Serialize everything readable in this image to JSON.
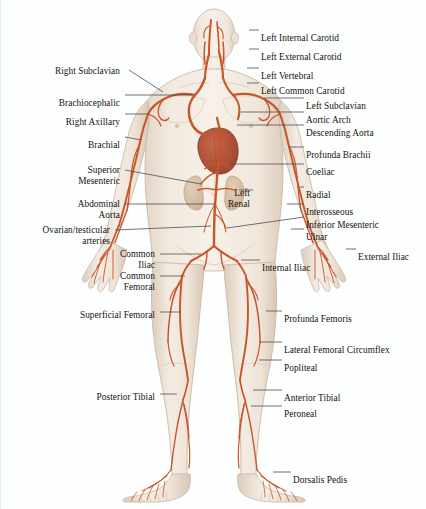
{
  "diagram": {
    "background_color": "#fdfefe",
    "artery_color": "#c8552b",
    "artery_color_dark": "#a8401f",
    "skin_fill": "#efe6dc",
    "skin_outline": "#c9b8a6",
    "heart_color": "#b4553c",
    "organ_color": "#d9c4ad",
    "leader_line_color": "#4a4a4a",
    "text_color": "#16130f"
  },
  "labels_left": [
    {
      "id": "right-subclavian",
      "text": "Right Subclavian",
      "x": 120,
      "y": 66,
      "align": "right",
      "lines": [
        "Right Subclavian"
      ]
    },
    {
      "id": "brachiocephalic",
      "text": "Brachiocephalic",
      "x": 120,
      "y": 98,
      "align": "right",
      "lines": [
        "Brachiocephalic"
      ]
    },
    {
      "id": "right-axillary",
      "text": "Right Axillary",
      "x": 120,
      "y": 117,
      "align": "right",
      "lines": [
        "Right Axillary"
      ]
    },
    {
      "id": "brachial",
      "text": "Brachial",
      "x": 120,
      "y": 140,
      "align": "right",
      "lines": [
        "Brachial"
      ]
    },
    {
      "id": "superior-mesenteric",
      "text": "Superior Mesenteric",
      "x": 120,
      "y": 165,
      "align": "right",
      "lines": [
        "Superior",
        "Mesenteric"
      ]
    },
    {
      "id": "abdominal-aorta",
      "text": "Abdominal Aorta",
      "x": 120,
      "y": 199,
      "align": "right",
      "lines": [
        "Abdominal",
        "Aorta"
      ]
    },
    {
      "id": "ovarian-testicular",
      "text": "Ovarian/testicular arteries",
      "x": 110,
      "y": 225,
      "align": "right",
      "lines": [
        "Ovarian/testicular",
        "arteries"
      ]
    },
    {
      "id": "common-iliac",
      "text": "Common Iliac",
      "x": 155,
      "y": 249,
      "align": "right",
      "lines": [
        "Common",
        "Iliac"
      ]
    },
    {
      "id": "common-femoral",
      "text": "Common Femoral",
      "x": 155,
      "y": 271,
      "align": "right",
      "lines": [
        "Common",
        "Femoral"
      ]
    },
    {
      "id": "superficial-femoral",
      "text": "Superficial Femoral",
      "x": 155,
      "y": 310,
      "align": "right",
      "lines": [
        "Superficial Femoral"
      ]
    },
    {
      "id": "posterior-tibial",
      "text": "Posterior Tibial",
      "x": 155,
      "y": 392,
      "align": "right",
      "lines": [
        "Posterior Tibial"
      ]
    }
  ],
  "labels_right": [
    {
      "id": "left-internal-carotid",
      "text": "Left Internal Carotid",
      "x": 260,
      "y": 33,
      "align": "left",
      "lines": [
        "Left Internal Carotid"
      ]
    },
    {
      "id": "left-external-carotid",
      "text": "Left External Carotid",
      "x": 260,
      "y": 52,
      "align": "left",
      "lines": [
        "Left External Carotid"
      ]
    },
    {
      "id": "left-vertebral",
      "text": "Left Vertebral",
      "x": 260,
      "y": 71,
      "align": "left",
      "lines": [
        "Left Vertebral"
      ]
    },
    {
      "id": "left-common-carotid",
      "text": "Left Common Carotid",
      "x": 260,
      "y": 86,
      "align": "left",
      "lines": [
        "Left Common Carotid"
      ]
    },
    {
      "id": "left-subclavian",
      "text": "Left Subclavian",
      "x": 305,
      "y": 101,
      "align": "left",
      "lines": [
        "Left Subclavian"
      ]
    },
    {
      "id": "aortic-arch",
      "text": "Aortic Arch",
      "x": 305,
      "y": 115,
      "align": "left",
      "lines": [
        "Aortic Arch"
      ]
    },
    {
      "id": "descending-aorta",
      "text": "Descending Aorta",
      "x": 305,
      "y": 128,
      "align": "left",
      "lines": [
        "Descending Aorta"
      ]
    },
    {
      "id": "profunda-brachii",
      "text": "Profunda Brachii",
      "x": 305,
      "y": 150,
      "align": "left",
      "lines": [
        "Profunda Brachii"
      ]
    },
    {
      "id": "coeliac",
      "text": "Coeliac",
      "x": 305,
      "y": 167,
      "align": "left",
      "lines": [
        "Coeliac"
      ]
    },
    {
      "id": "left-renal",
      "text": "Left Renal",
      "x": 250,
      "y": 188,
      "align": "right",
      "lines": [
        "Left",
        "Renal"
      ]
    },
    {
      "id": "radial",
      "text": "Radial",
      "x": 305,
      "y": 190,
      "align": "left",
      "lines": [
        "Radial"
      ]
    },
    {
      "id": "interosseous",
      "text": "Interosseous",
      "x": 305,
      "y": 207,
      "align": "left",
      "lines": [
        "Interosseous"
      ]
    },
    {
      "id": "inferior-mesenteric",
      "text": "Inferior Mesenteric",
      "x": 305,
      "y": 220,
      "align": "left",
      "lines": [
        "Inferior Mesenteric"
      ]
    },
    {
      "id": "ulnar",
      "text": "Ulnar",
      "x": 305,
      "y": 232,
      "align": "left",
      "lines": [
        "Ulnar"
      ]
    },
    {
      "id": "external-iliac",
      "text": "External Iliac",
      "x": 357,
      "y": 252,
      "align": "left",
      "lines": [
        "External Iliac"
      ]
    },
    {
      "id": "internal-iliac",
      "text": "Internal Iliac",
      "x": 261,
      "y": 263,
      "align": "left",
      "lines": [
        "Internal Iliac"
      ]
    },
    {
      "id": "profunda-femoris",
      "text": "Profunda Femoris",
      "x": 283,
      "y": 314,
      "align": "left",
      "lines": [
        "Profunda Femoris"
      ]
    },
    {
      "id": "lateral-femoral-circumflex",
      "text": "Lateral Femoral Circumflex",
      "x": 283,
      "y": 345,
      "align": "left",
      "lines": [
        "Lateral Femoral Circumflex"
      ]
    },
    {
      "id": "popliteal",
      "text": "Popliteal",
      "x": 283,
      "y": 363,
      "align": "left",
      "lines": [
        "Popliteal"
      ]
    },
    {
      "id": "anterior-tibial",
      "text": "Anterior Tibial",
      "x": 283,
      "y": 393,
      "align": "left",
      "lines": [
        "Anterior Tibial"
      ]
    },
    {
      "id": "peroneal",
      "text": "Peroneal",
      "x": 283,
      "y": 409,
      "align": "left",
      "lines": [
        "Peroneal"
      ]
    },
    {
      "id": "dorsalis-pedis",
      "text": "Dorsalis Pedis",
      "x": 292,
      "y": 475,
      "align": "left",
      "lines": [
        "Dorsalis Pedis"
      ]
    }
  ],
  "arteries_depicted": [
    "Left Internal Carotid",
    "Left External Carotid",
    "Left Vertebral",
    "Left Common Carotid",
    "Right Subclavian",
    "Left Subclavian",
    "Brachiocephalic",
    "Aortic Arch",
    "Descending Aorta",
    "Right Axillary",
    "Brachial",
    "Profunda Brachii",
    "Coeliac",
    "Superior Mesenteric",
    "Left Renal",
    "Abdominal Aorta",
    "Radial",
    "Ulnar",
    "Interosseous",
    "Inferior Mesenteric",
    "Ovarian/testicular arteries",
    "Common Iliac",
    "Internal Iliac",
    "External Iliac",
    "Common Femoral",
    "Profunda Femoris",
    "Superficial Femoral",
    "Lateral Femoral Circumflex",
    "Popliteal",
    "Anterior Tibial",
    "Posterior Tibial",
    "Peroneal",
    "Dorsalis Pedis"
  ]
}
